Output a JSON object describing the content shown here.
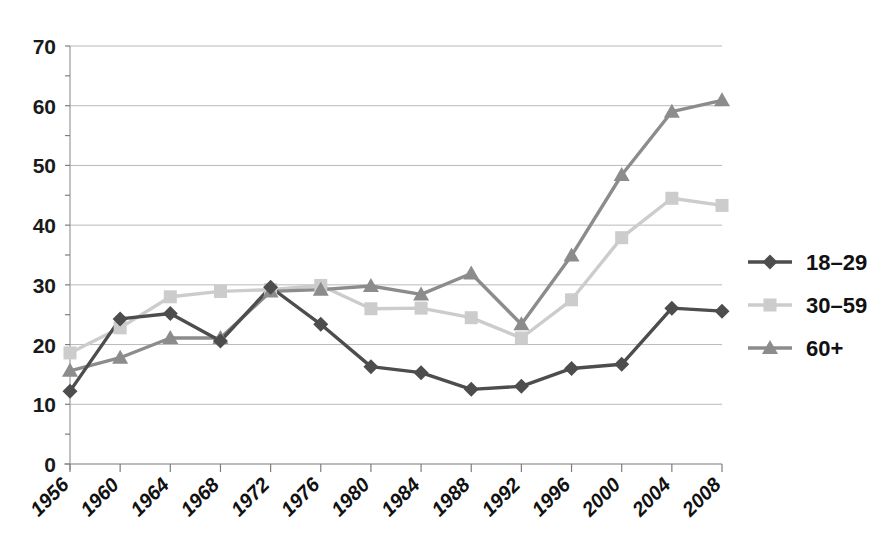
{
  "chart_data": {
    "type": "line",
    "title": "",
    "subtitle": "",
    "xlabel": "",
    "ylabel": "",
    "x": [
      1956,
      1960,
      1964,
      1968,
      1972,
      1976,
      1980,
      1984,
      1988,
      1992,
      1996,
      2000,
      2004,
      2008
    ],
    "categories": [
      "1956",
      "1960",
      "1964",
      "1968",
      "1972",
      "1976",
      "1980",
      "1984",
      "1988",
      "1992",
      "1996",
      "2000",
      "2004",
      "2008"
    ],
    "ylim": [
      0,
      70
    ],
    "ytick_values": [
      0,
      10,
      20,
      30,
      40,
      50,
      60,
      70
    ],
    "ytick_labels": [
      "0",
      "10",
      "20",
      "30",
      "40",
      "50",
      "60",
      "70"
    ],
    "grid": true,
    "grid_axis": "y",
    "legend_position": "right",
    "series": [
      {
        "name": "18–29",
        "color": "#4d4d4d",
        "marker": "diamond",
        "values": [
          12.2,
          24.3,
          25.2,
          20.6,
          29.6,
          23.4,
          16.3,
          15.3,
          12.5,
          13.0,
          16.0,
          16.7,
          26.1,
          25.6
        ]
      },
      {
        "name": "30–59",
        "color": "#cccccc",
        "marker": "square",
        "values": [
          18.6,
          22.8,
          28.0,
          28.9,
          29.2,
          29.9,
          26.0,
          26.1,
          24.5,
          21.1,
          27.5,
          37.9,
          44.5,
          43.3
        ]
      },
      {
        "name": "60+",
        "color": "#8c8c8c",
        "marker": "triangle",
        "values": [
          15.6,
          17.8,
          21.1,
          21.1,
          28.9,
          29.2,
          29.8,
          28.4,
          31.9,
          23.4,
          34.9,
          48.4,
          59.0,
          60.9
        ]
      }
    ]
  },
  "legend": {
    "items": [
      {
        "label": "18–29",
        "color": "#4d4d4d",
        "marker": "diamond"
      },
      {
        "label": "30–59",
        "color": "#cccccc",
        "marker": "square"
      },
      {
        "label": "60+",
        "color": "#8c8c8c",
        "marker": "triangle"
      }
    ]
  },
  "axes": {
    "y_ticks": [
      "70",
      "60",
      "50",
      "40",
      "30",
      "20",
      "10",
      "0"
    ],
    "x_ticks": [
      "1956",
      "1960",
      "1964",
      "1968",
      "1972",
      "1976",
      "1980",
      "1984",
      "1988",
      "1992",
      "1996",
      "2000",
      "2004",
      "2008"
    ]
  }
}
